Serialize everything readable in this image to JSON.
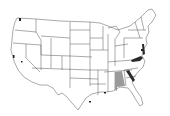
{
  "map": {
    "title": "United States state outline map",
    "background": "#ffffff",
    "outline_color": "#555555",
    "highlights": [
      {
        "region": "Alabama",
        "shade": "light",
        "color": "#9a9a9a"
      },
      {
        "region": "Georgia (eastern strip)",
        "shade": "dark",
        "color": "#2a2a2a"
      },
      {
        "region": "Virginia / Maryland",
        "shade": "dark",
        "color": "#2a2a2a"
      },
      {
        "region": "Delaware / New Jersey",
        "shade": "dark",
        "color": "#2a2a2a"
      }
    ],
    "markers": [
      {
        "location": "Seattle, WA"
      },
      {
        "location": "San Francisco Bay, CA"
      },
      {
        "location": "Lake Tahoe area, NV"
      },
      {
        "location": "Houston, TX"
      },
      {
        "location": "Mobile / New Orleans coast"
      }
    ]
  }
}
